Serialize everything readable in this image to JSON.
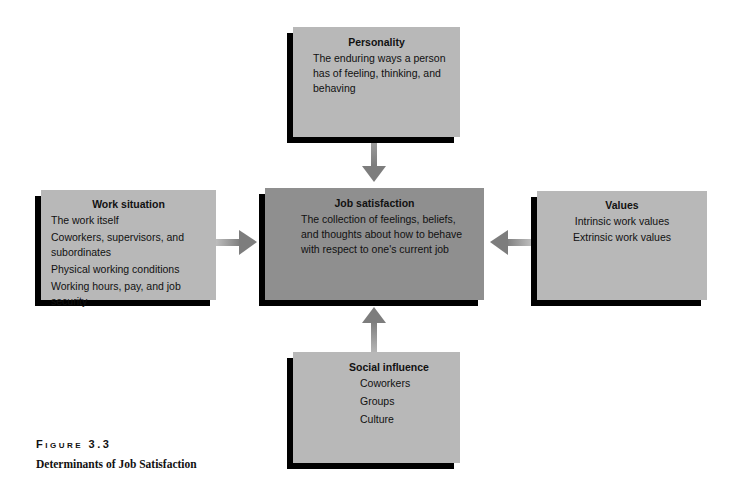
{
  "diagram": {
    "center": {
      "title": "Job satisfaction",
      "description": "The collection of feelings, beliefs, and thoughts about how to behave with respect to one's current job"
    },
    "personality": {
      "title": "Personality",
      "description": "The enduring ways a person has of feeling, thinking, and behaving"
    },
    "work_situation": {
      "title": "Work situation",
      "items": [
        "The work itself",
        "Coworkers, supervisors, and subordinates",
        "Physical working conditions",
        "Working hours, pay, and job security"
      ]
    },
    "values": {
      "title": "Values",
      "items": [
        "Intrinsic work values",
        "Extrinsic work values"
      ]
    },
    "social_influence": {
      "title": "Social influence",
      "items": [
        "Coworkers",
        "Groups",
        "Culture"
      ]
    },
    "arrows": [
      {
        "from": "personality",
        "to": "center",
        "direction": "down"
      },
      {
        "from": "work_situation",
        "to": "center",
        "direction": "right"
      },
      {
        "from": "values",
        "to": "center",
        "direction": "left"
      },
      {
        "from": "social_influence",
        "to": "center",
        "direction": "up"
      }
    ],
    "colors": {
      "box_fill": "#b8b8b8",
      "center_fill": "#8f8f8f",
      "shadow": "#000000",
      "arrow": "#8a8a8a"
    }
  },
  "caption": {
    "figure_label": "Figure 3.3",
    "title": "Determinants of Job Satisfaction"
  }
}
